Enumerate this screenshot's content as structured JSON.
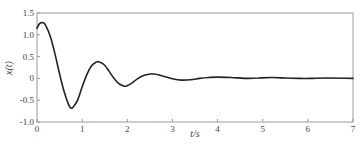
{
  "chart_data": {
    "type": "line",
    "title": "",
    "xlabel": "t/s",
    "ylabel": "x(t)",
    "xlim": [
      0,
      7
    ],
    "ylim": [
      -1.0,
      1.5
    ],
    "xticks": [
      0,
      1,
      2,
      3,
      4,
      5,
      6,
      7
    ],
    "xtick_labels": [
      "0",
      "1",
      "2",
      "3",
      "4",
      "5",
      "6",
      "7"
    ],
    "yticks": [
      -1.0,
      -0.5,
      0,
      0.5,
      1.0,
      1.5
    ],
    "ytick_labels": [
      "-1.0",
      "-0.5",
      "0",
      "0.5",
      "1.0",
      "1.5"
    ],
    "grid": false,
    "legend": null,
    "series": [
      {
        "name": "x(t)",
        "color": "#222222",
        "description": "damped oscillation settling to 0",
        "x": [
          0,
          0.05,
          0.1,
          0.15,
          0.2,
          0.3,
          0.4,
          0.5,
          0.6,
          0.7,
          0.75,
          0.8,
          0.9,
          1.0,
          1.1,
          1.2,
          1.3,
          1.35,
          1.4,
          1.5,
          1.6,
          1.7,
          1.8,
          1.9,
          1.95,
          2.0,
          2.1,
          2.2,
          2.3,
          2.4,
          2.5,
          2.6,
          2.7,
          2.8,
          2.9,
          3.0,
          3.2,
          3.4,
          3.6,
          3.8,
          4.0,
          4.3,
          4.6,
          4.9,
          5.2,
          5.5,
          5.8,
          6.1,
          6.4,
          7.0
        ],
        "y": [
          1.15,
          1.25,
          1.28,
          1.27,
          1.2,
          0.95,
          0.55,
          0.1,
          -0.3,
          -0.6,
          -0.68,
          -0.66,
          -0.5,
          -0.2,
          0.08,
          0.28,
          0.37,
          0.38,
          0.37,
          0.3,
          0.16,
          0.01,
          -0.11,
          -0.17,
          -0.18,
          -0.17,
          -0.11,
          -0.03,
          0.04,
          0.08,
          0.1,
          0.1,
          0.08,
          0.05,
          0.02,
          -0.01,
          -0.04,
          -0.03,
          0.0,
          0.02,
          0.03,
          0.02,
          0.0,
          0.01,
          0.02,
          0.01,
          0.0,
          0.0,
          0.01,
          0.0
        ]
      }
    ]
  }
}
